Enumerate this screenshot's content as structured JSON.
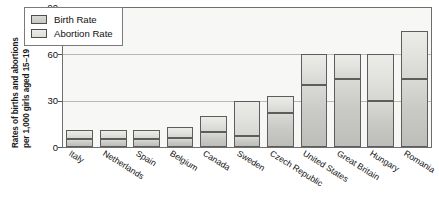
{
  "chart_data": {
    "type": "bar",
    "subtype": "stacked-bar",
    "title": "",
    "xlabel": "",
    "ylabel": "Rates of births and abortions per 1,000 girls aged 15–19",
    "ylabel_line1": "Rates of births and abortions",
    "ylabel_line2": "per 1,000 girls aged 15–19",
    "ylim": [
      0,
      90
    ],
    "yticks": [
      0,
      30,
      60,
      90
    ],
    "ytick_labels": [
      "0",
      "30",
      "60",
      "90"
    ],
    "grid": true,
    "legend_position": "top-left-inside",
    "categories": [
      "Italy",
      "Netherlands",
      "Spain",
      "Belgium",
      "Canada",
      "Sweden",
      "Czech Republic",
      "United States",
      "Great Britain",
      "Hungary",
      "Romania"
    ],
    "series": [
      {
        "name": "Birth Rate",
        "values": [
          5,
          5,
          5,
          6,
          10,
          7,
          22,
          40,
          44,
          30,
          44
        ]
      },
      {
        "name": "Abortion Rate",
        "values": [
          6,
          6,
          6,
          7,
          10,
          23,
          11,
          20,
          16,
          30,
          31
        ]
      }
    ],
    "totals": [
      11,
      11,
      11,
      13,
      20,
      30,
      33,
      60,
      60,
      60,
      75
    ],
    "colors": {
      "birth_rate": "#c9c9c5",
      "abortion_rate": "#e4e4e1",
      "axis": "#6e6e6e",
      "grid": "#b9b9b9",
      "plot_background": "#f7f7f5"
    }
  },
  "legend": {
    "items": [
      {
        "label": "Birth Rate",
        "swatch": "birth-rate-swatch"
      },
      {
        "label": "Abortion Rate",
        "swatch": "abortion-rate-swatch"
      }
    ]
  }
}
